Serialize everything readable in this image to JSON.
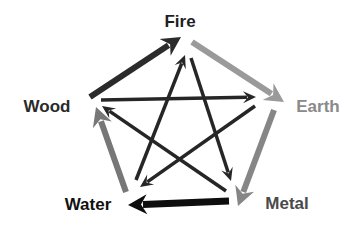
{
  "nodes": [
    {
      "id": "fire",
      "label": "Fire",
      "x": 180,
      "y": 22,
      "color": "#1f1f1f"
    },
    {
      "id": "earth",
      "label": "Earth",
      "x": 318,
      "y": 107,
      "color": "#8a8a8a"
    },
    {
      "id": "metal",
      "label": "Metal",
      "x": 287,
      "y": 204,
      "color": "#4a4a4a"
    },
    {
      "id": "water",
      "label": "Water",
      "x": 88,
      "y": 205,
      "color": "#111111"
    },
    {
      "id": "wood",
      "label": "Wood",
      "x": 47,
      "y": 107,
      "color": "#2a2a2a"
    }
  ],
  "generating_cycle": [
    {
      "from": "wood",
      "to": "fire",
      "x1": 90,
      "y1": 97,
      "x2": 181,
      "y2": 37,
      "color": "#2b2b2b",
      "width": 6
    },
    {
      "from": "fire",
      "to": "earth",
      "x1": 192,
      "y1": 42,
      "x2": 284,
      "y2": 102,
      "color": "#9a9a9a",
      "width": 6
    },
    {
      "from": "earth",
      "to": "metal",
      "x1": 274,
      "y1": 110,
      "x2": 238,
      "y2": 206,
      "color": "#868686",
      "width": 6
    },
    {
      "from": "metal",
      "to": "water",
      "x1": 229,
      "y1": 201,
      "x2": 128,
      "y2": 205,
      "color": "#0e0e0e",
      "width": 7
    },
    {
      "from": "water",
      "to": "wood",
      "x1": 126,
      "y1": 192,
      "x2": 96,
      "y2": 107,
      "color": "#777777",
      "width": 6
    }
  ],
  "controlling_cycle": [
    {
      "from": "wood",
      "to": "earth",
      "x1": 101,
      "y1": 100,
      "x2": 256,
      "y2": 97,
      "color": "#262626",
      "width": 3.5
    },
    {
      "from": "earth",
      "to": "water",
      "x1": 255,
      "y1": 106,
      "x2": 140,
      "y2": 187,
      "color": "#262626",
      "width": 3.5
    },
    {
      "from": "water",
      "to": "fire",
      "x1": 136,
      "y1": 180,
      "x2": 185,
      "y2": 55,
      "color": "#262626",
      "width": 3.5
    },
    {
      "from": "fire",
      "to": "metal",
      "x1": 191,
      "y1": 58,
      "x2": 231,
      "y2": 181,
      "color": "#262626",
      "width": 3.5
    },
    {
      "from": "metal",
      "to": "wood",
      "x1": 226,
      "y1": 191,
      "x2": 102,
      "y2": 106,
      "color": "#262626",
      "width": 3.5
    }
  ]
}
